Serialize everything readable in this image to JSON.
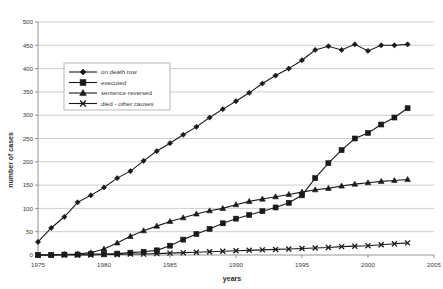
{
  "chart_data": {
    "type": "line",
    "title": "",
    "xlabel": "years",
    "ylabel": "number of cases",
    "xlim": [
      1975,
      2005
    ],
    "ylim": [
      0,
      500
    ],
    "xticks": [
      1975,
      1980,
      1985,
      1990,
      1995,
      2000,
      2005
    ],
    "yticks": [
      0,
      50,
      100,
      150,
      200,
      250,
      300,
      350,
      400,
      450,
      500
    ],
    "grid": true,
    "legend_position": "upper-left-inside",
    "x": [
      1975,
      1976,
      1977,
      1978,
      1979,
      1980,
      1981,
      1982,
      1983,
      1984,
      1985,
      1986,
      1987,
      1988,
      1989,
      1990,
      1991,
      1992,
      1993,
      1994,
      1995,
      1996,
      1997,
      1998,
      1999,
      2000,
      2001,
      2002,
      2003
    ],
    "series": [
      {
        "name": "on death row",
        "marker": "diamond",
        "values": [
          28,
          58,
          82,
          113,
          128,
          145,
          165,
          180,
          202,
          223,
          240,
          258,
          275,
          295,
          313,
          330,
          348,
          368,
          385,
          400,
          418,
          440,
          448,
          440,
          452,
          438,
          450,
          450,
          452
        ]
      },
      {
        "name": "executed",
        "marker": "square",
        "values": [
          0,
          0,
          1,
          1,
          2,
          2,
          3,
          5,
          7,
          10,
          20,
          33,
          45,
          56,
          68,
          78,
          86,
          94,
          102,
          112,
          128,
          165,
          197,
          225,
          250,
          262,
          280,
          295,
          315
        ]
      },
      {
        "name": "sentence reversed",
        "marker": "triangle",
        "values": [
          0,
          0,
          1,
          2,
          5,
          13,
          26,
          40,
          52,
          62,
          72,
          80,
          88,
          95,
          100,
          108,
          115,
          120,
          125,
          130,
          135,
          140,
          143,
          148,
          152,
          155,
          158,
          160,
          162
        ]
      },
      {
        "name": "died - other causes",
        "marker": "x",
        "values": [
          0,
          0,
          0,
          0,
          0,
          1,
          1,
          2,
          2,
          3,
          4,
          5,
          6,
          7,
          8,
          9,
          10,
          11,
          12,
          13,
          14,
          15,
          16,
          18,
          19,
          20,
          22,
          24,
          26
        ]
      }
    ]
  },
  "colors": {
    "series": "#1a1a1a",
    "grid": "#b9b9b9",
    "axis": "#7a7a7a",
    "background": "#ffffff",
    "text": "#3a3a3a"
  }
}
